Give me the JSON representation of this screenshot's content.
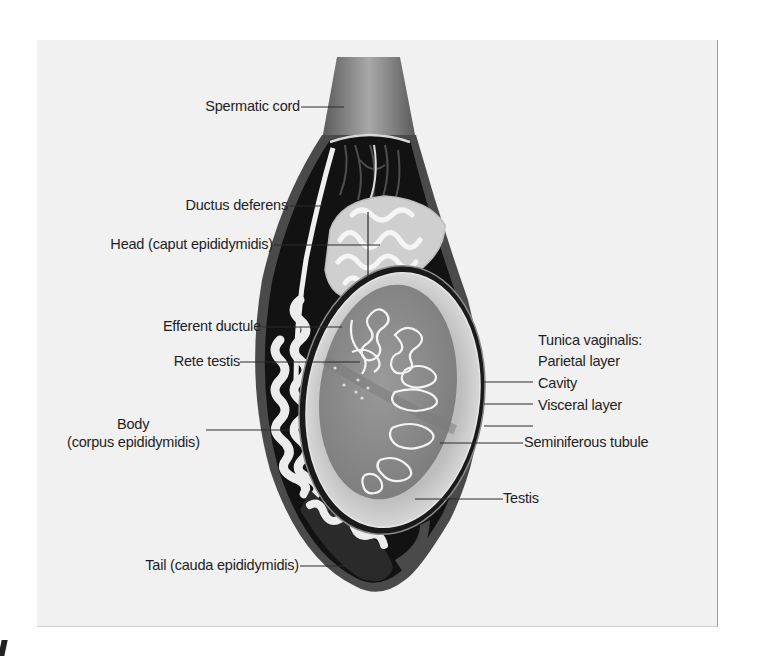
{
  "diagram": {
    "labels": {
      "spermatic_cord": "Spermatic cord",
      "ductus_deferens": "Ductus deferens",
      "head": "Head (caput epididymidis)",
      "efferent_ductule": "Efferent ductule",
      "rete_testis": "Rete testis",
      "body_line1": "Body",
      "body_line2": "(corpus epididymidis)",
      "tail": "Tail (cauda epididymidis)",
      "tunica_vaginalis": "Tunica vaginalis:",
      "parietal_layer": "Parietal layer",
      "cavity": "Cavity",
      "visceral_layer": "Visceral layer",
      "seminiferous_tubule": "Seminiferous tubule",
      "testis": "Testis"
    },
    "colors": {
      "panel_bg": "#f1f1f1",
      "outer_sheath": "#4a4a4a",
      "cord": "#7a7a7a",
      "cavity_dark": "#111111",
      "testis_tissue": "#8c8c8c",
      "albuginea": "#cfcfcf",
      "tubule_white": "#f2f2f2",
      "leader_line": "#2a2a2a"
    }
  }
}
